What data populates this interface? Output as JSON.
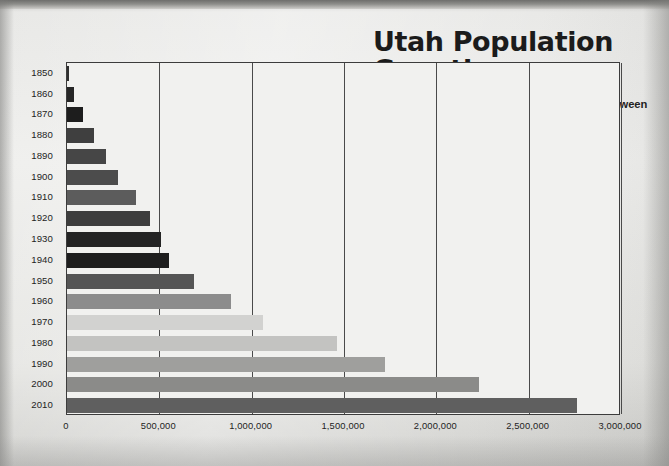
{
  "header": {
    "title": "Utah Population Growth",
    "subtitle": "This chart shows Utah's population growth between 1850 and 2010.",
    "source": "Source: U.S. Census Bureau, 2010 census"
  },
  "chart_data": {
    "type": "bar",
    "orientation": "horizontal",
    "title": "Utah Population Growth",
    "subtitle": "This chart shows Utah's population growth between 1850 and 2010.",
    "source": "Source: U.S. Census Bureau, 2010 census",
    "xlabel": "",
    "ylabel": "",
    "xlim": [
      0,
      3000000
    ],
    "xticks": [
      0,
      500000,
      1000000,
      1500000,
      2000000,
      2500000,
      3000000
    ],
    "xtick_labels": [
      "0",
      "500,000",
      "1,000,000",
      "1,500,000",
      "2,000,000",
      "2,500,000",
      "3,000,000"
    ],
    "grid": "vertical",
    "legend": "none",
    "categories": [
      "1850",
      "1860",
      "1870",
      "1880",
      "1890",
      "1900",
      "1910",
      "1920",
      "1930",
      "1940",
      "1950",
      "1960",
      "1970",
      "1980",
      "1990",
      "2000",
      "2010"
    ],
    "values": [
      11380,
      40125,
      86786,
      143963,
      210779,
      276749,
      373351,
      449396,
      507847,
      550310,
      688862,
      890627,
      1059273,
      1461037,
      1722850,
      2233169,
      2763885
    ],
    "bar_colors": [
      "#2f2f2f",
      "#262626",
      "#1d1d1d",
      "#3f3f3f",
      "#464646",
      "#4c4c4c",
      "#5c5c5c",
      "#3d3d3d",
      "#242424",
      "#1e1e1e",
      "#555555",
      "#8c8c8c",
      "#d2d2d0",
      "#c3c3c1",
      "#9f9f9d",
      "#8b8b89",
      "#5f5f5f"
    ]
  },
  "axis": {
    "y_labels": [
      "1850",
      "1860",
      "1870",
      "1880",
      "1890",
      "1900",
      "1910",
      "1920",
      "1930",
      "1940",
      "1950",
      "1960",
      "1970",
      "1980",
      "1990",
      "2000",
      "2010"
    ],
    "x_labels": [
      "0",
      "500,000",
      "1,000,000",
      "1,500,000",
      "2,000,000",
      "2,500,000",
      "3,000,000"
    ]
  }
}
